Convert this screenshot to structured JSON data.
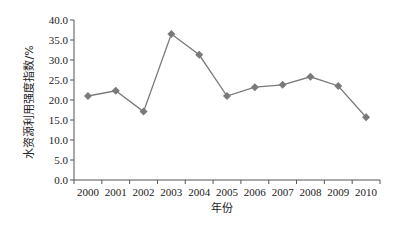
{
  "chart_data": {
    "type": "line",
    "title": "",
    "xlabel": "年份",
    "ylabel": "水资源利用强度指数/%",
    "categories": [
      "2000",
      "2001",
      "2002",
      "2003",
      "2004",
      "2005",
      "2006",
      "2007",
      "2008",
      "2009",
      "2010"
    ],
    "series": [
      {
        "name": "水资源利用强度指数",
        "values": [
          21.0,
          22.3,
          17.1,
          36.5,
          31.3,
          21.0,
          23.2,
          23.8,
          25.8,
          23.5,
          15.7
        ]
      }
    ],
    "ylim": [
      0,
      40
    ],
    "yticks": [
      "0.0",
      "5.0",
      "10.0",
      "15.0",
      "20.0",
      "25.0",
      "30.0",
      "35.0",
      "40.0"
    ],
    "grid": false,
    "legend": "none",
    "marker": "diamond",
    "colors": {
      "line": "#7a7a7a",
      "marker": "#7a7a7a",
      "axis": "#555555"
    }
  }
}
